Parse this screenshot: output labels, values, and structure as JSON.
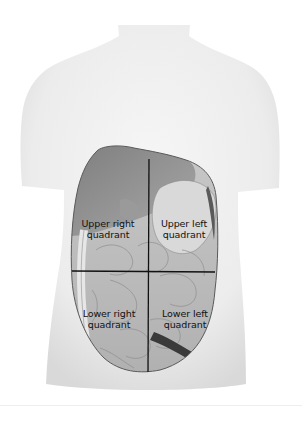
{
  "diagram": {
    "quadrants": [
      {
        "id": "upper-right",
        "line1": "Upper right",
        "line2": "quadrant"
      },
      {
        "id": "upper-left",
        "line1": "Upper left",
        "line2": "quadrant"
      },
      {
        "id": "lower-right",
        "line1": "Lower right",
        "line2": "quadrant"
      },
      {
        "id": "lower-left",
        "line1": "Lower left",
        "line2": "quadrant"
      }
    ],
    "colors": {
      "skin": "#eeeeee",
      "skin_shadow": "#d6d6d6",
      "organ_dark": "#8f8f8f",
      "organ_mid": "#b5b5b5",
      "organ_light": "#d2d2d2",
      "divider_line": "#111111",
      "label_text": "#111111"
    }
  }
}
